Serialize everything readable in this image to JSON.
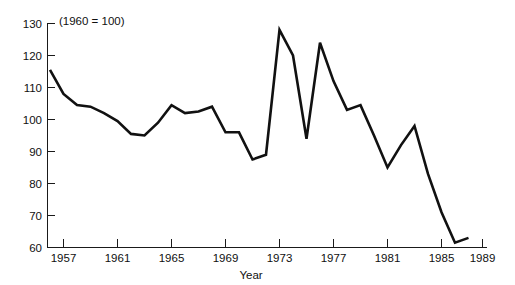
{
  "chart_data": {
    "type": "line",
    "title": "",
    "subtitle": "",
    "annotation": "(1960 = 100)",
    "xlabel": "Year",
    "ylabel": "",
    "xlim": [
      1956,
      1989
    ],
    "ylim": [
      60,
      130
    ],
    "grid": false,
    "legend": "none",
    "x_ticks": [
      1957,
      1961,
      1965,
      1969,
      1973,
      1977,
      1981,
      1985,
      1989
    ],
    "x_tick_labels": [
      "1957",
      "1961",
      "1965",
      "1969",
      "1973",
      "1977",
      "1981",
      "1985",
      "1989"
    ],
    "y_ticks": [
      60,
      70,
      80,
      90,
      100,
      110,
      120,
      130
    ],
    "y_tick_labels": [
      "60",
      "70",
      "80",
      "90",
      "100",
      "110",
      "120",
      "130"
    ],
    "series": [
      {
        "name": "index",
        "color": "#111111",
        "x": [
          1956,
          1957,
          1958,
          1959,
          1960,
          1961,
          1962,
          1963,
          1964,
          1965,
          1966,
          1967,
          1968,
          1969,
          1970,
          1971,
          1972,
          1973,
          1974,
          1975,
          1976,
          1977,
          1978,
          1979,
          1980,
          1981,
          1982,
          1983,
          1984,
          1985,
          1986,
          1987
        ],
        "values": [
          115.5,
          108.0,
          104.5,
          104.0,
          102.0,
          99.5,
          95.5,
          95.0,
          99.0,
          104.5,
          102.0,
          102.5,
          104.0,
          96.0,
          96.0,
          87.5,
          89.0,
          128.0,
          120.0,
          94.0,
          124.0,
          112.0,
          103.0,
          104.5,
          95.0,
          85.0,
          92.0,
          98.0,
          83.0,
          71.0,
          61.5,
          63.0
        ]
      }
    ]
  },
  "axis": {
    "x_title": "Year"
  },
  "note": {
    "text": "(1960 = 100)"
  }
}
